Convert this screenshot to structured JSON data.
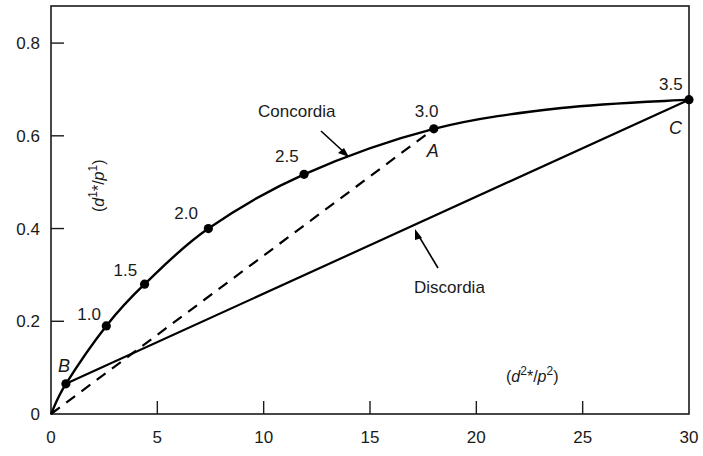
{
  "chart_data": {
    "type": "line",
    "title": "",
    "xlabel": {
      "open": "(",
      "var": "d",
      "sup1": "2",
      "star": "*/",
      "var2": "p",
      "sup2": "2",
      "close": ")"
    },
    "ylabel": {
      "open": "(",
      "var": "d",
      "sup1": "1",
      "star": "*/",
      "var2": "p",
      "sup2": "1",
      "close": ")"
    },
    "xlim": [
      0,
      30
    ],
    "ylim": [
      0,
      0.88
    ],
    "grid": false,
    "x_ticks": [
      0,
      5,
      10,
      15,
      20,
      25,
      30
    ],
    "x_tick_labels": [
      "0",
      "5",
      "10",
      "15",
      "20",
      "25",
      "30"
    ],
    "y_ticks": [
      0,
      0.2,
      0.4,
      0.6,
      0.8
    ],
    "y_tick_labels": [
      "0",
      "0.2",
      "0.4",
      "0.6",
      "0.8"
    ],
    "series": [
      {
        "name": "Concordia",
        "style": "solid",
        "points": [
          {
            "x": 0,
            "y": 0
          },
          {
            "x": 0.7,
            "y": 0.065
          },
          {
            "x": 2.6,
            "y": 0.19
          },
          {
            "x": 4.4,
            "y": 0.28
          },
          {
            "x": 7.4,
            "y": 0.4
          },
          {
            "x": 11.9,
            "y": 0.517
          },
          {
            "x": 18.0,
            "y": 0.615
          },
          {
            "x": 24.0,
            "y": 0.66
          },
          {
            "x": 30.0,
            "y": 0.678
          }
        ]
      },
      {
        "name": "Discordia",
        "style": "solid",
        "points": [
          {
            "x": 0.7,
            "y": 0.065
          },
          {
            "x": 30.0,
            "y": 0.678
          }
        ]
      },
      {
        "name": "Reference",
        "style": "dashed",
        "points": [
          {
            "x": 0,
            "y": 0
          },
          {
            "x": 18.0,
            "y": 0.615
          }
        ]
      }
    ],
    "age_markers": [
      {
        "label": "1.0",
        "x": 2.6,
        "y": 0.19
      },
      {
        "label": "1.5",
        "x": 4.4,
        "y": 0.28
      },
      {
        "label": "2.0",
        "x": 7.4,
        "y": 0.4
      },
      {
        "label": "2.5",
        "x": 11.9,
        "y": 0.517
      },
      {
        "label": "3.0",
        "x": 18.0,
        "y": 0.615
      },
      {
        "label": "3.5",
        "x": 30.0,
        "y": 0.678
      }
    ],
    "named_points": [
      {
        "label": "B",
        "x": 0.7,
        "y": 0.065
      },
      {
        "label": "A",
        "x": 18.0,
        "y": 0.615
      },
      {
        "label": "C",
        "x": 30.0,
        "y": 0.678
      }
    ],
    "annotations": [
      {
        "text": "Concordia",
        "target": "Concordia"
      },
      {
        "text": "Discordia",
        "target": "Discordia"
      }
    ]
  }
}
